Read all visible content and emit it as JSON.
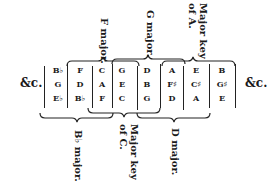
{
  "diagram": {
    "type": "key-relationship-table",
    "left_ellipsis": "&c.",
    "right_ellipsis": "&c.",
    "columns": [
      {
        "notes": [
          "B♭",
          "G",
          "E♭"
        ]
      },
      {
        "notes": [
          "F",
          "D",
          "B♭"
        ]
      },
      {
        "notes": [
          "C",
          "A",
          "F"
        ]
      },
      {
        "notes": [
          "G",
          "E",
          "C"
        ]
      },
      {
        "notes": [
          "D",
          "B",
          "G"
        ]
      },
      {
        "notes": [
          "A",
          "F♯",
          "D"
        ]
      },
      {
        "notes": [
          "E",
          "C♯",
          "A"
        ]
      },
      {
        "notes": [
          "B",
          "G♯",
          "E"
        ]
      }
    ],
    "top_labels": [
      {
        "line1": "F major.",
        "line2": ""
      },
      {
        "line1": "G major.",
        "line2": ""
      },
      {
        "line1": "Major key",
        "line2": "of A."
      }
    ],
    "bottom_labels": [
      {
        "line1": "B♭ major.",
        "line2": ""
      },
      {
        "line1": "Major key",
        "line2": "of C."
      },
      {
        "line1": "D major.",
        "line2": ""
      }
    ]
  }
}
